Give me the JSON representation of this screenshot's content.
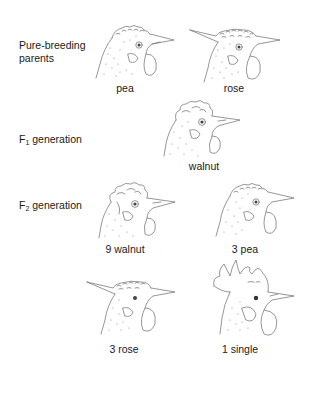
{
  "figure": {
    "rows": [
      {
        "id": "parents",
        "label_line1": "Pure-breeding",
        "label_line2": "parents",
        "individuals": [
          {
            "comb": "pea",
            "caption": "pea"
          },
          {
            "comb": "rose",
            "caption": "rose"
          }
        ]
      },
      {
        "id": "f1",
        "label_prefix": "F",
        "label_sub": "1",
        "label_suffix": " generation",
        "individuals": [
          {
            "comb": "walnut",
            "caption": "walnut"
          }
        ]
      },
      {
        "id": "f2",
        "label_prefix": "F",
        "label_sub": "2",
        "label_suffix": " generation",
        "individuals": [
          {
            "comb": "walnut",
            "caption": "9 walnut"
          },
          {
            "comb": "pea",
            "caption": "3 pea"
          },
          {
            "comb": "rose",
            "caption": "3 rose"
          },
          {
            "comb": "single",
            "caption": "1 single"
          }
        ]
      }
    ]
  }
}
